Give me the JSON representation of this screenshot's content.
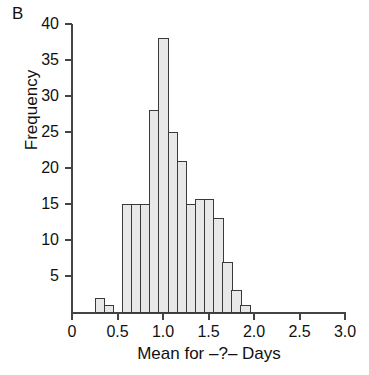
{
  "panel": {
    "label": "B"
  },
  "axes": {
    "ylabel": "Frequency",
    "xlabel": "Mean for –?– Days"
  },
  "chart_data": {
    "type": "bar",
    "title": "",
    "subtitle": "",
    "panel_label": "B",
    "xlabel": "Mean for –?– Days",
    "ylabel": "Frequency",
    "xlim": [
      0,
      3.0
    ],
    "ylim": [
      0,
      40
    ],
    "xticks": [
      0,
      0.5,
      1.0,
      1.5,
      2.0,
      2.5,
      3.0
    ],
    "xtick_labels": [
      "0",
      "0.5",
      "1.0",
      "1.5",
      "2.0",
      "2.5",
      "3.0"
    ],
    "yticks": [
      5,
      10,
      15,
      20,
      25,
      30,
      35,
      40
    ],
    "ytick_labels": [
      "5",
      "10",
      "15",
      "20",
      "25",
      "30",
      "35",
      "40"
    ],
    "grid": false,
    "legend": null,
    "bin_width": 0.1,
    "bin_edges": [
      0.25,
      0.35,
      0.45,
      0.55,
      0.65,
      0.75,
      0.85,
      0.95,
      1.05,
      1.15,
      1.25,
      1.35,
      1.45,
      1.55,
      1.65,
      1.75,
      1.85,
      1.95,
      2.05
    ],
    "categories": [
      "0.25-0.35",
      "0.35-0.45",
      "0.45-0.55",
      "0.55-0.65",
      "0.65-0.75",
      "0.75-0.85",
      "0.85-0.95",
      "0.95-1.05",
      "1.05-1.15",
      "1.15-1.25",
      "1.25-1.35",
      "1.35-1.45",
      "1.45-1.55",
      "1.55-1.65",
      "1.65-1.75",
      "1.75-1.85",
      "1.85-1.95",
      "1.95-2.05"
    ],
    "values": [
      2,
      1,
      0,
      15,
      15,
      15,
      28,
      38,
      25,
      21,
      15,
      15.7,
      13,
      13,
      7,
      3,
      1,
      0
    ],
    "bars": [
      {
        "x0": 0.25,
        "x1": 0.35,
        "value": 2
      },
      {
        "x0": 0.35,
        "x1": 0.45,
        "value": 1
      },
      {
        "x0": 0.55,
        "x1": 0.65,
        "value": 15
      },
      {
        "x0": 0.65,
        "x1": 0.75,
        "value": 15
      },
      {
        "x0": 0.75,
        "x1": 0.85,
        "value": 15
      },
      {
        "x0": 0.85,
        "x1": 0.95,
        "value": 28
      },
      {
        "x0": 0.95,
        "x1": 1.05,
        "value": 38
      },
      {
        "x0": 1.05,
        "x1": 1.15,
        "value": 25
      },
      {
        "x0": 1.15,
        "x1": 1.25,
        "value": 21
      },
      {
        "x0": 1.25,
        "x1": 1.35,
        "value": 15
      },
      {
        "x0": 1.35,
        "x1": 1.45,
        "value": 15.7
      },
      {
        "x0": 1.45,
        "x1": 1.55,
        "value": 15.7
      },
      {
        "x0": 1.55,
        "x1": 1.65,
        "value": 13
      },
      {
        "x0": 1.65,
        "x1": 1.75,
        "value": 7
      },
      {
        "x0": 1.75,
        "x1": 1.85,
        "value": 3
      },
      {
        "x0": 1.85,
        "x1": 1.95,
        "value": 1
      }
    ],
    "colors": {
      "bar_fill": "#e8e8e8",
      "bar_edge": "#3a3a3a",
      "axis": "#444444",
      "text": "#111111",
      "background": "#ffffff"
    }
  }
}
